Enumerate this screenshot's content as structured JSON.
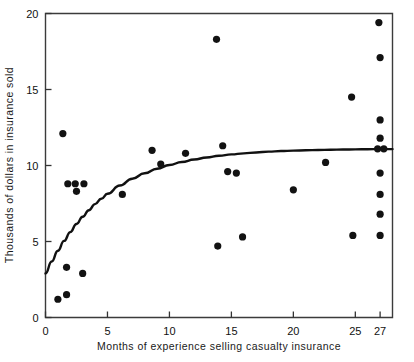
{
  "chart_data": {
    "type": "scatter",
    "title": "",
    "xlabel": "Months of experience selling casualty insurance",
    "ylabel": "Thousands of dollars in insurance sold",
    "xlim": [
      0,
      28
    ],
    "ylim": [
      0,
      20
    ],
    "xticks": [
      0,
      5,
      10,
      15,
      20,
      25,
      27
    ],
    "xtick_labels": [
      "0",
      "5",
      "10",
      "15",
      "20",
      "25",
      "27"
    ],
    "yticks": [
      0,
      5,
      10,
      15,
      20
    ],
    "ytick_labels": [
      "0",
      "5",
      "10",
      "15",
      "20"
    ],
    "grid": false,
    "legend": false,
    "marker": "filled-circle",
    "marker_color": "#121212",
    "points": [
      {
        "x": 1.0,
        "y": 1.2
      },
      {
        "x": 1.7,
        "y": 1.5
      },
      {
        "x": 1.7,
        "y": 3.3
      },
      {
        "x": 1.4,
        "y": 12.1
      },
      {
        "x": 1.8,
        "y": 8.8
      },
      {
        "x": 2.4,
        "y": 8.8
      },
      {
        "x": 2.5,
        "y": 8.3
      },
      {
        "x": 3.1,
        "y": 8.8
      },
      {
        "x": 3.0,
        "y": 2.9
      },
      {
        "x": 6.2,
        "y": 8.1
      },
      {
        "x": 8.6,
        "y": 11.0
      },
      {
        "x": 9.3,
        "y": 10.1
      },
      {
        "x": 11.3,
        "y": 10.8
      },
      {
        "x": 13.8,
        "y": 18.3
      },
      {
        "x": 13.9,
        "y": 4.7
      },
      {
        "x": 14.3,
        "y": 11.3
      },
      {
        "x": 14.7,
        "y": 9.6
      },
      {
        "x": 15.4,
        "y": 9.5
      },
      {
        "x": 15.9,
        "y": 5.3
      },
      {
        "x": 20.0,
        "y": 8.4
      },
      {
        "x": 22.6,
        "y": 10.2
      },
      {
        "x": 24.7,
        "y": 14.5
      },
      {
        "x": 24.8,
        "y": 5.4
      },
      {
        "x": 26.9,
        "y": 19.4
      },
      {
        "x": 27.0,
        "y": 17.1
      },
      {
        "x": 27.0,
        "y": 13.0
      },
      {
        "x": 27.0,
        "y": 11.8
      },
      {
        "x": 26.8,
        "y": 11.1
      },
      {
        "x": 27.3,
        "y": 11.1
      },
      {
        "x": 27.0,
        "y": 9.5
      },
      {
        "x": 27.0,
        "y": 8.1
      },
      {
        "x": 27.0,
        "y": 6.8
      },
      {
        "x": 27.0,
        "y": 5.4
      }
    ],
    "fit_curve": {
      "name": "exponential-rise-to-asymptote",
      "description": "y = 11.1 - 8.2 * exp(-x / 5.1)",
      "asymptote": 11.1,
      "y_intercept": 2.9,
      "points": [
        {
          "x": 0.0,
          "y": 2.9
        },
        {
          "x": 0.5,
          "y": 3.68
        },
        {
          "x": 1.0,
          "y": 4.39
        },
        {
          "x": 1.5,
          "y": 5.04
        },
        {
          "x": 2.0,
          "y": 5.62
        },
        {
          "x": 2.5,
          "y": 6.15
        },
        {
          "x": 3.0,
          "y": 6.63
        },
        {
          "x": 3.5,
          "y": 7.06
        },
        {
          "x": 4.0,
          "y": 7.46
        },
        {
          "x": 4.5,
          "y": 7.81
        },
        {
          "x": 5.0,
          "y": 8.14
        },
        {
          "x": 6.0,
          "y": 8.68
        },
        {
          "x": 7.0,
          "y": 9.13
        },
        {
          "x": 8.0,
          "y": 9.49
        },
        {
          "x": 9.0,
          "y": 9.79
        },
        {
          "x": 10.0,
          "y": 10.03
        },
        {
          "x": 11.0,
          "y": 10.23
        },
        {
          "x": 12.0,
          "y": 10.39
        },
        {
          "x": 13.0,
          "y": 10.53
        },
        {
          "x": 14.0,
          "y": 10.64
        },
        {
          "x": 15.0,
          "y": 10.73
        },
        {
          "x": 16.0,
          "y": 10.8
        },
        {
          "x": 17.0,
          "y": 10.86
        },
        {
          "x": 18.0,
          "y": 10.91
        },
        {
          "x": 19.0,
          "y": 10.95
        },
        {
          "x": 20.0,
          "y": 10.98
        },
        {
          "x": 21.0,
          "y": 11.0
        },
        {
          "x": 22.0,
          "y": 11.02
        },
        {
          "x": 23.0,
          "y": 11.04
        },
        {
          "x": 24.0,
          "y": 11.05
        },
        {
          "x": 25.0,
          "y": 11.06
        },
        {
          "x": 26.0,
          "y": 11.07
        },
        {
          "x": 27.0,
          "y": 11.08
        },
        {
          "x": 28.0,
          "y": 11.08
        }
      ]
    }
  }
}
